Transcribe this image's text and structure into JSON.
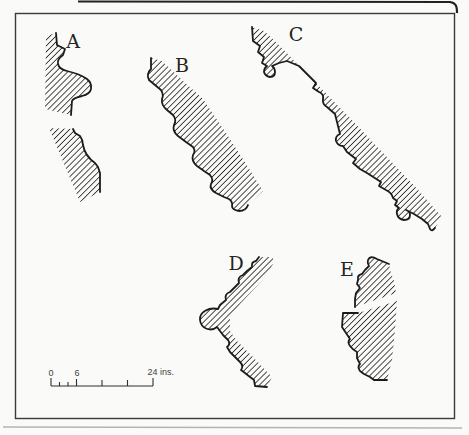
{
  "figure": {
    "kind": "moulding-profile-sections",
    "profiles": [
      {
        "id": "A",
        "label": "A"
      },
      {
        "id": "B",
        "label": "B"
      },
      {
        "id": "C",
        "label": "C"
      },
      {
        "id": "D",
        "label": "D"
      },
      {
        "id": "E",
        "label": "E"
      }
    ],
    "scale_bar": {
      "label_start": "0",
      "label_mid": "6",
      "label_end": "24 ins."
    },
    "colors": {
      "paper": "#fafaf8",
      "ink": "#1b1b1b",
      "hatch": "#2d2d2d",
      "border": "#3a3a3a",
      "page_shadow": "#b3b3af"
    }
  }
}
